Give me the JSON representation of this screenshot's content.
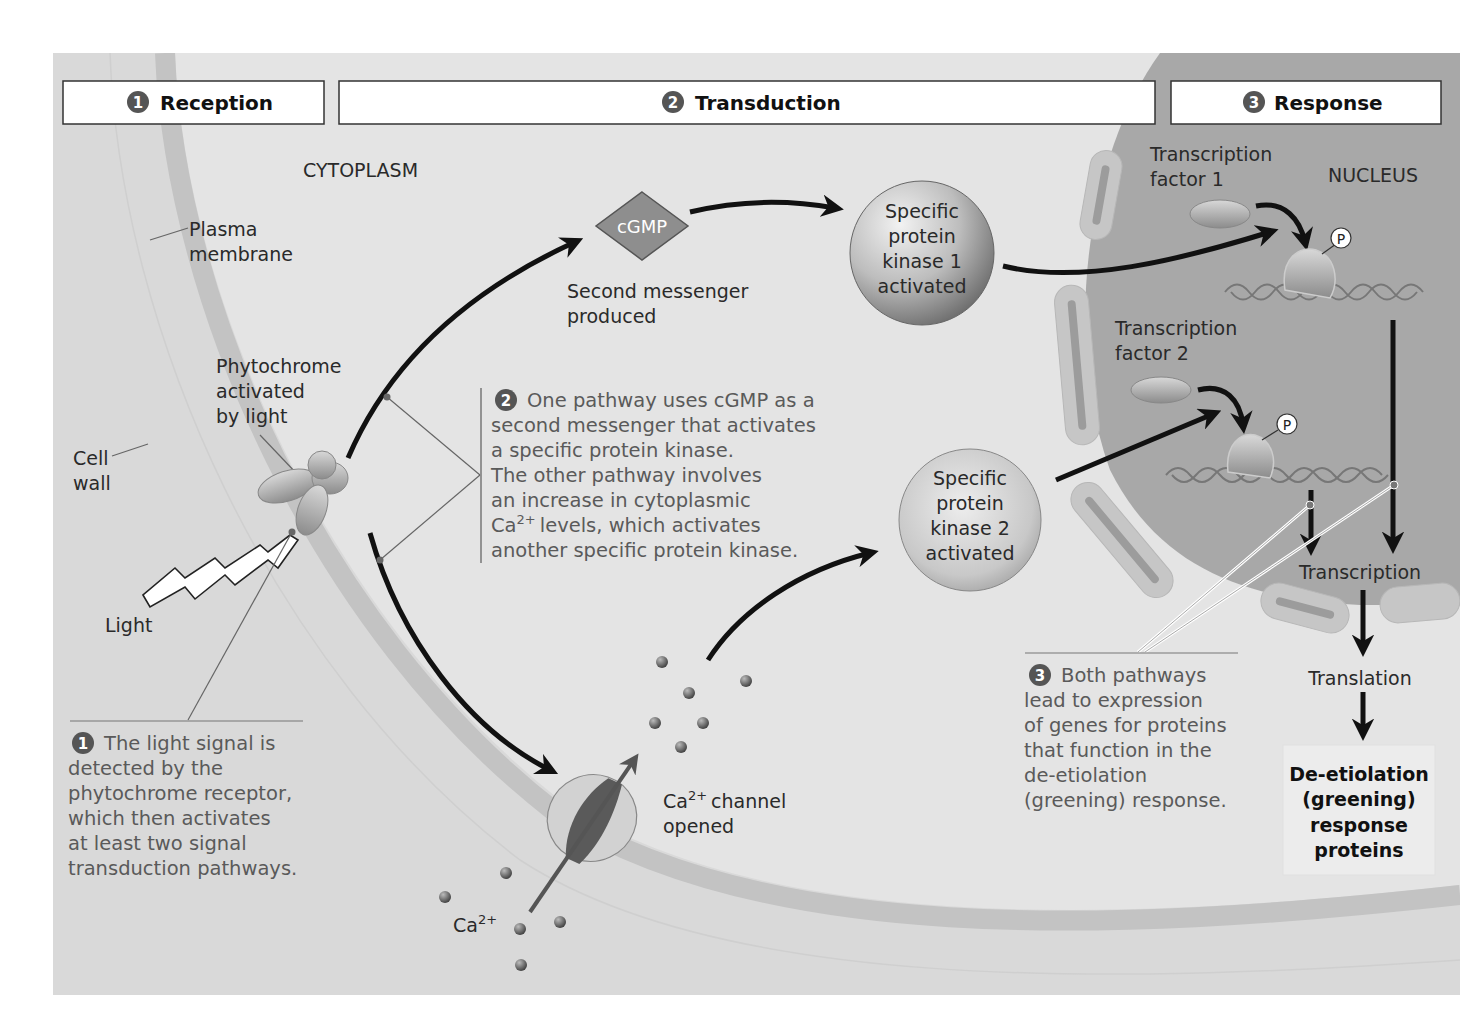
{
  "headers": [
    {
      "number": "1",
      "label": "Reception"
    },
    {
      "number": "2",
      "label": "Transduction"
    },
    {
      "number": "3",
      "label": "Response"
    }
  ],
  "regions": {
    "cytoplasm": "CYTOPLASM",
    "nucleus": "NUCLEUS"
  },
  "labels": {
    "plasma_membrane": [
      "Plasma",
      "membrane"
    ],
    "cell_wall": [
      "Cell",
      "wall"
    ],
    "phytochrome": [
      "Phytochrome",
      "activated",
      "by light"
    ],
    "light": "Light",
    "cgmp": "cGMP",
    "second_messenger": [
      "Second messenger",
      "produced"
    ],
    "kinase1": [
      "Specific",
      "protein",
      "kinase 1",
      "activated"
    ],
    "kinase2": [
      "Specific",
      "protein",
      "kinase 2",
      "activated"
    ],
    "tf1": [
      "Transcription",
      "factor 1"
    ],
    "tf2": [
      "Transcription",
      "factor 2"
    ],
    "phosphate": "P",
    "transcription": "Transcription",
    "translation": "Translation",
    "response_proteins": [
      "De-etiolation",
      "(greening)",
      "response",
      "proteins"
    ],
    "ca_channel": [
      "channel",
      "opened"
    ],
    "ca_ion": "Ca",
    "ca_charge": "2+"
  },
  "captions": {
    "step1": {
      "number": "1",
      "lines": [
        "The light signal is",
        "detected by the",
        "phytochrome receptor,",
        "which then activates",
        "at least two signal",
        "transduction pathways."
      ]
    },
    "step2": {
      "number": "2",
      "lines": [
        "One pathway uses cGMP as a",
        "second messenger that activates",
        "a specific protein kinase.",
        "The other pathway involves",
        "an increase in cytoplasmic",
        "levels, which activates",
        "another specific protein kinase."
      ],
      "ca_prefix": "Ca",
      "ca_charge": "2+"
    },
    "step3": {
      "number": "3",
      "lines": [
        "Both pathways",
        "lead to expression",
        "of genes for proteins",
        "that function in the",
        "de-etiolation",
        "(greening) response."
      ]
    }
  },
  "colors": {
    "cytoplasm": "#e2e2e2",
    "cell_wall": "#d6d6d6",
    "membrane": "#c4c4c4",
    "nucleus": "#a7a7a7",
    "nuclear_envelope": "#c7c7c7"
  }
}
